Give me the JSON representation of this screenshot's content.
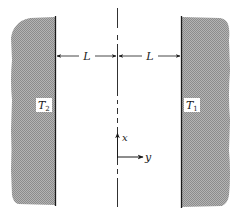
{
  "figure": {
    "colors": {
      "wall_fill": "#a9a9a9",
      "wall_edge": "#1a1a1a",
      "line": "#1a1a1a",
      "background": "#ffffff",
      "label_box": "#ffffff"
    },
    "walls": {
      "left": {
        "label_main": "T",
        "label_sub": "2"
      },
      "right": {
        "label_main": "T",
        "label_sub": "1"
      }
    },
    "dimensions": {
      "left_span": "L",
      "right_span": "L"
    },
    "axes": {
      "x_label": "x",
      "y_label": "y"
    }
  }
}
